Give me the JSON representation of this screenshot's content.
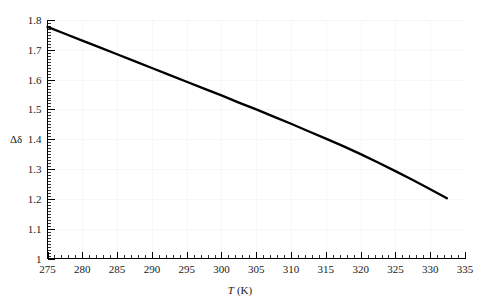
{
  "chart_data": {
    "type": "line",
    "title": "",
    "xlabel": "T (K)",
    "xlabel_symbol": "T",
    "xlabel_unit": "(K)",
    "ylabel": "Δδ",
    "xlim": [
      275,
      335
    ],
    "ylim": [
      1.0,
      1.8
    ],
    "grid": true,
    "legend": "none",
    "x_major_ticks": [
      275,
      280,
      285,
      290,
      295,
      300,
      305,
      310,
      315,
      320,
      325,
      330,
      335
    ],
    "x_tick_labels": [
      "275",
      "280",
      "285",
      "290",
      "295",
      "300",
      "305",
      "310",
      "315",
      "320",
      "325",
      "330",
      "335"
    ],
    "x_minor_interval": 1,
    "y_major_ticks": [
      1.0,
      1.1,
      1.2,
      1.3,
      1.4,
      1.5,
      1.6,
      1.7,
      1.8
    ],
    "y_tick_labels": [
      "1",
      "1.1",
      "1.2",
      "1.3",
      "1.4",
      "1.5",
      "1.6",
      "1.7",
      "1.8"
    ],
    "y_minor_interval": 0.01,
    "series": [
      {
        "name": "delta-delta-vs-temperature",
        "color": "#000000",
        "x": [
          275.0,
          277.5,
          280.0,
          282.5,
          285.0,
          287.5,
          290.0,
          292.5,
          295.0,
          297.5,
          300.0,
          302.5,
          305.0,
          307.5,
          310.0,
          312.5,
          315.0,
          317.5,
          320.0,
          322.5,
          325.0,
          327.5,
          330.0,
          332.4
        ],
        "y": [
          1.777,
          1.754,
          1.731,
          1.708,
          1.685,
          1.662,
          1.639,
          1.616,
          1.593,
          1.57,
          1.547,
          1.523,
          1.5,
          1.476,
          1.452,
          1.427,
          1.402,
          1.377,
          1.35,
          1.322,
          1.293,
          1.263,
          1.232,
          1.202
        ]
      }
    ]
  },
  "axes": {
    "y_axis_label": "Δδ",
    "x_axis_label_symbol": "T",
    "x_axis_label_unit": "(K)"
  }
}
